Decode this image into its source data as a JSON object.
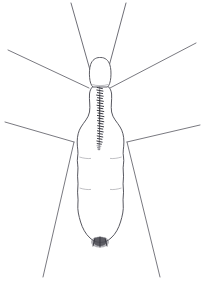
{
  "figure": {
    "title": "Insect line drawing",
    "subject_name": "crane-fly",
    "view": "dorsal",
    "background_color": "#ffffff",
    "canvas": {
      "width": 202,
      "height": 281
    }
  },
  "palette": {
    "outline": "#4f4f57",
    "leg_stroke": "#6a6a72",
    "antenna_stroke": "#6f6f77",
    "thorax_marking": "#3a3a42",
    "tail_patch": "#4a4a52",
    "paper": "#ffffff"
  },
  "anatomy": {
    "head": {
      "label": "head",
      "outline_points": "97,58 93,60 90,65 89,72 90,79 92,84 96,86 101,86 105,83 107,77 107,69 105,62 101,58 97,58"
    },
    "thorax": {
      "label": "thorax",
      "marking_label": "striated-dorsal-stripe",
      "stripe_top_y": 86,
      "stripe_bottom_y": 146
    },
    "body": {
      "label": "abdomen",
      "outline_points": "99,84 93,86 90,92 89,100 90,110 88,118 83,124 79,132 77,142 78,152 77,162 78,172 77,182 78,193 77,203 78,213 80,222 84,231 90,238 97,242 104,242 111,238 117,231 121,222 123,213 124,203 123,193 124,183 123,173 124,163 123,153 124,143 122,133 118,125 113,118 111,110 112,100 111,92 108,86 103,84 99,84",
      "widest_x_left": 77,
      "widest_x_right": 124,
      "tip_y": 242
    },
    "tail": {
      "label": "terminal-dark-patch",
      "center_x": 100,
      "center_y": 242,
      "width": 18,
      "height": 11
    }
  },
  "appendages": {
    "antennae": [
      {
        "name": "antenna-left",
        "x1": 90,
        "y1": 70,
        "x2": 71,
        "y2": 3
      },
      {
        "name": "antenna-right",
        "x1": 108,
        "y1": 70,
        "x2": 126,
        "y2": 3
      }
    ],
    "legs": [
      {
        "name": "foreleg-left",
        "x1": 89,
        "y1": 88,
        "x2": 8,
        "y2": 50
      },
      {
        "name": "foreleg-right",
        "x1": 110,
        "y1": 88,
        "x2": 196,
        "y2": 43
      },
      {
        "name": "midleg-left",
        "x1": 74,
        "y1": 142,
        "x2": 5,
        "y2": 122
      },
      {
        "name": "midleg-right",
        "x1": 127,
        "y1": 142,
        "x2": 200,
        "y2": 125
      },
      {
        "name": "hindleg-left",
        "x1": 74,
        "y1": 142,
        "x2": 43,
        "y2": 277
      },
      {
        "name": "hindleg-right",
        "x1": 127,
        "y1": 142,
        "x2": 160,
        "y2": 277
      }
    ],
    "counts": {
      "antennae": 2,
      "legs": 6
    }
  },
  "markings": {
    "stripe_segments": 26,
    "description": "dark striated median band"
  }
}
